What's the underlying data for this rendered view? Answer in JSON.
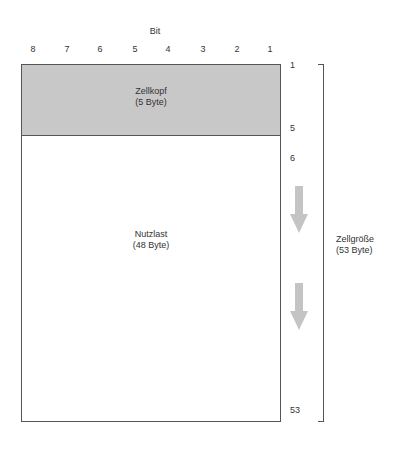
{
  "bit_axis": {
    "title": "Bit",
    "labels": [
      "8",
      "7",
      "6",
      "5",
      "4",
      "3",
      "2",
      "1"
    ]
  },
  "header_section": {
    "name": "Zellkopf",
    "size": "(5 Byte)",
    "fill": "#c8c8c8"
  },
  "payload_section": {
    "name": "Nutzlast",
    "size": "(48 Byte)"
  },
  "row_numbers": {
    "first": "1",
    "header_end": "5",
    "payload_start": "6",
    "last": "53"
  },
  "cell_size": {
    "name": "Zellgröße",
    "size": "(53 Byte)"
  },
  "arrows": [
    {
      "icon": "down-arrow-icon"
    },
    {
      "icon": "down-arrow-icon"
    }
  ]
}
